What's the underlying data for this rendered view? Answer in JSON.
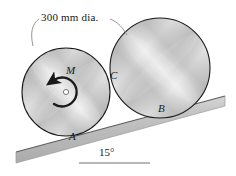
{
  "figure": {
    "dimension_label": "300 mm dia.",
    "angle_label": "15°",
    "labels": {
      "moment": "M",
      "contact_disc_disc": "C",
      "contact_left_incline": "A",
      "contact_right_incline": "B"
    },
    "colors": {
      "outline": "#1a1a1a",
      "incline_fill": "#b9b9b9",
      "incline_edge": "#6e6e6e",
      "metal_light": "#ffffff",
      "metal_mid": "#cfcfcf",
      "metal_dark": "#9a9a9a",
      "leader": "#8a8a8a",
      "text": "#1a1a1a"
    },
    "geometry": {
      "incline_angle_deg": 15,
      "disc_diameter_mm": 300,
      "left_disc": {
        "cx": 66,
        "cy": 92,
        "r": 44
      },
      "right_disc": {
        "cx": 160,
        "cy": 68,
        "r": 50
      },
      "moment_sense": "clockwise"
    }
  }
}
